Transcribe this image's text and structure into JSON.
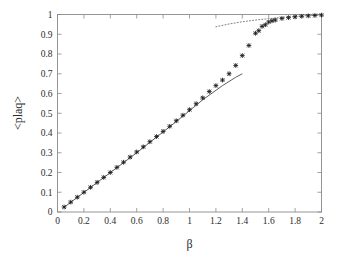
{
  "figure": {
    "background_color": "#ffffff",
    "frame_color": "#8a8a8a",
    "marker_color": "#1a1a1a",
    "line_color": "#4a4a4a",
    "dotted_color": "#6f6f6f"
  },
  "axes": {
    "x_title": "β",
    "y_title": "<plaq>",
    "x_ticks": [
      "0",
      "0.2",
      "0.4",
      "0.6",
      "0.8",
      "1",
      "1.2",
      "1.4",
      "1.6",
      "1.8",
      "2"
    ],
    "y_ticks": [
      "0",
      "0.1",
      "0.2",
      "0.3",
      "0.4",
      "0.5",
      "0.6",
      "0.7",
      "0.8",
      "0.9",
      "1"
    ]
  },
  "chart_data": {
    "type": "scatter",
    "title": "",
    "xlabel": "β",
    "ylabel": "<plaq>",
    "xlim": [
      0,
      2
    ],
    "ylim": [
      0,
      1
    ],
    "grid": false,
    "legend": "none",
    "x_tick_values": [
      0,
      0.2,
      0.4,
      0.6,
      0.8,
      1,
      1.2,
      1.4,
      1.6,
      1.8,
      2
    ],
    "y_tick_values": [
      0,
      0.1,
      0.2,
      0.3,
      0.4,
      0.5,
      0.6,
      0.7,
      0.8,
      0.9,
      1
    ],
    "series": [
      {
        "name": "measured plaquette",
        "type": "scatter",
        "marker": "star",
        "color": "#1a1a1a",
        "x": [
          0.05,
          0.1,
          0.15,
          0.2,
          0.25,
          0.3,
          0.35,
          0.4,
          0.45,
          0.5,
          0.55,
          0.6,
          0.65,
          0.7,
          0.75,
          0.8,
          0.85,
          0.9,
          0.95,
          1.0,
          1.05,
          1.1,
          1.15,
          1.2,
          1.25,
          1.3,
          1.35,
          1.4,
          1.45,
          1.5,
          1.525,
          1.55,
          1.575,
          1.6,
          1.625,
          1.65,
          1.7,
          1.75,
          1.8,
          1.85,
          1.9,
          1.95,
          2.0
        ],
        "y": [
          0.025,
          0.05,
          0.075,
          0.1,
          0.125,
          0.15,
          0.175,
          0.2,
          0.226,
          0.252,
          0.278,
          0.304,
          0.33,
          0.356,
          0.382,
          0.408,
          0.434,
          0.462,
          0.49,
          0.518,
          0.548,
          0.578,
          0.61,
          0.64,
          0.668,
          0.7,
          0.742,
          0.792,
          0.843,
          0.905,
          0.918,
          0.94,
          0.948,
          0.962,
          0.968,
          0.972,
          0.98,
          0.984,
          0.988,
          0.991,
          0.993,
          0.995,
          0.997
        ]
      },
      {
        "name": "strong coupling expansion",
        "type": "line",
        "style": "solid",
        "color": "#4a4a4a",
        "x": [
          0.05,
          0.3,
          0.6,
          0.9,
          1.1,
          1.25,
          1.35,
          1.4
        ],
        "y": [
          0.024,
          0.149,
          0.3,
          0.458,
          0.568,
          0.64,
          0.682,
          0.7
        ]
      },
      {
        "name": "weak coupling expansion",
        "type": "line",
        "style": "dotted",
        "color": "#6f6f6f",
        "x": [
          1.2,
          1.3,
          1.4,
          1.5,
          1.6,
          1.7,
          1.8,
          1.9,
          2.0
        ],
        "y": [
          0.938,
          0.952,
          0.963,
          0.972,
          0.979,
          0.985,
          0.99,
          0.995,
          0.999
        ]
      }
    ]
  }
}
